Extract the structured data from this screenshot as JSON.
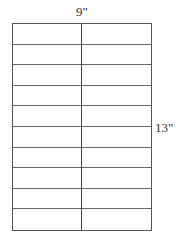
{
  "diagram": {
    "type": "label-sheet-layout",
    "width_label": "9\"",
    "height_label": "13\"",
    "columns": 2,
    "rows": 10,
    "line_color": "#555555",
    "background": "#ffffff"
  }
}
